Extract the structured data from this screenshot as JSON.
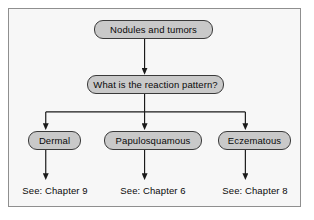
{
  "figure": {
    "type": "flowchart",
    "colors": {
      "page_background": "#ffffff",
      "canvas_background": "#f7f7f7",
      "frame_border": "#8f8f8f",
      "node_fill": "#c9c9c9",
      "node_border": "#3a3a3a",
      "connector": "#1a1a1a",
      "text": "#0a0a0a"
    }
  },
  "nodes": {
    "root": {
      "label": "Nodules and tumors"
    },
    "decision": {
      "label": "What is the reaction pattern?"
    },
    "branches": [
      {
        "label": "Dermal"
      },
      {
        "label": "Papulosquamous"
      },
      {
        "label": "Eczematous"
      }
    ]
  },
  "captions": [
    {
      "label": "See: Chapter 9"
    },
    {
      "label": "See: Chapter 6"
    },
    {
      "label": "See: Chapter 8"
    }
  ],
  "edges": [
    {
      "from": "root",
      "to": "decision",
      "arrow": "down"
    },
    {
      "from": "decision",
      "to": "dermal",
      "arrow": "down"
    },
    {
      "from": "decision",
      "to": "papulosquamous",
      "arrow": "down"
    },
    {
      "from": "decision",
      "to": "eczematous",
      "arrow": "down"
    },
    {
      "from": "dermal",
      "to": "see-chapter-9",
      "arrow": "down"
    },
    {
      "from": "papulosquamous",
      "to": "see-chapter-6",
      "arrow": "down"
    },
    {
      "from": "eczematous",
      "to": "see-chapter-8",
      "arrow": "down"
    }
  ]
}
